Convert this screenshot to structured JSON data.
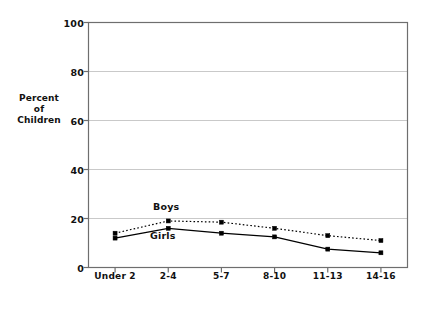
{
  "chart_data": {
    "type": "line",
    "title": "",
    "xlabel": "Age of Child in Years",
    "ylabel": "Percent of Children",
    "ylabel_lines": [
      "Percent",
      "of",
      "Children"
    ],
    "categories": [
      "Under 2",
      "2-4",
      "5-7",
      "8-10",
      "11-13",
      "14-16"
    ],
    "yticks": [
      0,
      20,
      40,
      60,
      80,
      100
    ],
    "ytick_labels": [
      "0",
      "20",
      "40",
      "60",
      "80",
      "100"
    ],
    "ylim": [
      0,
      100
    ],
    "grid": "horizontal",
    "legend_position": "inline-labels",
    "series": [
      {
        "name": "Boys",
        "style": "dotted",
        "marker": "square",
        "color": "#000000",
        "values": [
          14,
          19,
          18.5,
          16,
          13,
          11
        ]
      },
      {
        "name": "Girls",
        "style": "solid",
        "marker": "square",
        "color": "#000000",
        "values": [
          12,
          16,
          14,
          12.5,
          7.5,
          6
        ]
      }
    ],
    "annotations": [
      {
        "text": "Boys",
        "series": "Boys"
      },
      {
        "text": "Girls",
        "series": "Girls"
      }
    ]
  },
  "colors": {
    "frame": "#6e6e6e",
    "grid": "#c9c9c9",
    "ink": "#111111"
  }
}
